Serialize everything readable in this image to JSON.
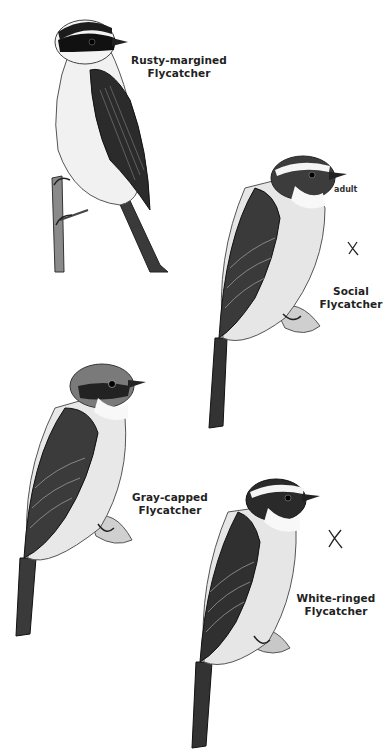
{
  "plate": {
    "background": "#ffffff",
    "ink_color": "#1a1a1a"
  },
  "birds": [
    {
      "id": "rusty-margined",
      "label_line1": "Rusty-margined",
      "label_line2": "Flycatcher",
      "note": "",
      "mark": ""
    },
    {
      "id": "social",
      "label_line1": "Social",
      "label_line2": "Flycatcher",
      "note": "adult",
      "mark": "X"
    },
    {
      "id": "gray-capped",
      "label_line1": "Gray-capped",
      "label_line2": "Flycatcher",
      "note": "",
      "mark": ""
    },
    {
      "id": "white-ringed",
      "label_line1": "White-ringed",
      "label_line2": "Flycatcher",
      "note": "",
      "mark": "X"
    }
  ]
}
